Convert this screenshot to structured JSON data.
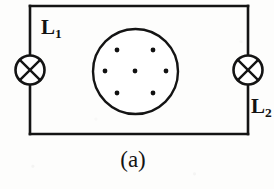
{
  "figure": {
    "caption": "(a)",
    "background_color": "#fdfdfc",
    "stroke_color": "#141414",
    "type": "circuit-diagram",
    "circuit": {
      "loop": {
        "shape": "rectangle",
        "left": 30,
        "top": 6,
        "right": 248,
        "bottom": 134,
        "stroke_width": 2.6
      },
      "lamps": [
        {
          "id": "lamp-left",
          "label": "L",
          "subscript": "1",
          "symbol": "circle-with-x",
          "cx": 30,
          "cy": 70,
          "r": 14.5,
          "label_x": 41,
          "label_y": 17
        },
        {
          "id": "lamp-right",
          "label": "L",
          "subscript": "2",
          "symbol": "circle-with-x",
          "cx": 248,
          "cy": 70,
          "r": 14.5,
          "label_x": 251,
          "label_y": 96
        }
      ],
      "field_region": {
        "id": "field-dots-circle",
        "shape": "circle",
        "cx": 135.5,
        "cy": 71.5,
        "r": 42.5,
        "stroke_width": 2.4,
        "dot_radius": 2.4,
        "dot_color": "#111111",
        "dot_count": 7,
        "dots": [
          {
            "x": 117,
            "y": 50
          },
          {
            "x": 153,
            "y": 50
          },
          {
            "x": 105,
            "y": 71
          },
          {
            "x": 135,
            "y": 71
          },
          {
            "x": 166,
            "y": 71
          },
          {
            "x": 117,
            "y": 93
          },
          {
            "x": 153,
            "y": 93
          }
        ]
      }
    }
  }
}
